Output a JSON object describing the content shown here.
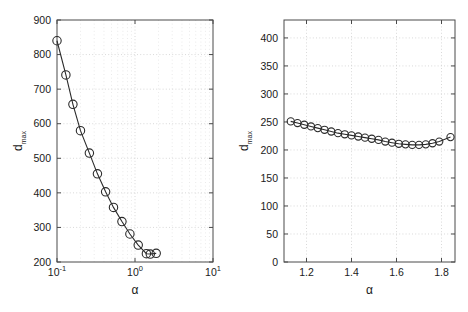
{
  "figure": {
    "background": "#ffffff",
    "line_color": "#2b2b2b",
    "grid_color": "#c9c9c9",
    "axis_color": "#4a4a4a"
  },
  "chart_data": [
    {
      "id": "left",
      "type": "line",
      "title": "",
      "xlabel": "α",
      "ylabel": "d",
      "ylabel_sub": "max",
      "xscale": "log",
      "yscale": "linear",
      "xlim": [
        0.1,
        10
      ],
      "ylim": [
        200,
        900
      ],
      "grid": true,
      "legend": null,
      "marker": "circle",
      "xtick_labels": [
        "10",
        "10",
        "10"
      ],
      "xtick_exponents": [
        "-1",
        "0",
        "1"
      ],
      "xticks": [
        0.1,
        1,
        10
      ],
      "yticks": [
        200,
        300,
        400,
        500,
        600,
        700,
        800,
        900
      ],
      "ytick_labels": [
        "200",
        "300",
        "400",
        "500",
        "600",
        "700",
        "800",
        "900"
      ],
      "x": [
        0.1,
        0.13,
        0.16,
        0.2,
        0.26,
        0.33,
        0.42,
        0.53,
        0.68,
        0.86,
        1.1,
        1.4,
        1.57,
        1.87
      ],
      "y": [
        840,
        741,
        656,
        580,
        515,
        455,
        403,
        358,
        317,
        281,
        249,
        224,
        223,
        225
      ]
    },
    {
      "id": "right",
      "type": "line",
      "title": "",
      "xlabel": "α",
      "ylabel": "d",
      "ylabel_sub": "max",
      "xscale": "linear",
      "yscale": "linear",
      "xlim": [
        1.1,
        1.86
      ],
      "ylim": [
        0,
        432
      ],
      "grid": true,
      "legend": null,
      "marker": "circle",
      "xticks": [
        1.2,
        1.4,
        1.6,
        1.8
      ],
      "xtick_labels": [
        "1.2",
        "1.4",
        "1.6",
        "1.8"
      ],
      "yticks": [
        0,
        50,
        100,
        150,
        200,
        250,
        300,
        350,
        400
      ],
      "ytick_labels": [
        "0",
        "50",
        "100",
        "150",
        "200",
        "250",
        "300",
        "350",
        "400"
      ],
      "x": [
        1.13,
        1.16,
        1.19,
        1.22,
        1.25,
        1.28,
        1.31,
        1.34,
        1.37,
        1.4,
        1.43,
        1.46,
        1.49,
        1.52,
        1.55,
        1.58,
        1.61,
        1.64,
        1.67,
        1.7,
        1.73,
        1.76,
        1.79,
        1.84
      ],
      "y": [
        251,
        248,
        245,
        242,
        239,
        236,
        233,
        230,
        228,
        226,
        224,
        222,
        220,
        218,
        215,
        213,
        211,
        210,
        209,
        209,
        210,
        212,
        215,
        223
      ]
    }
  ]
}
